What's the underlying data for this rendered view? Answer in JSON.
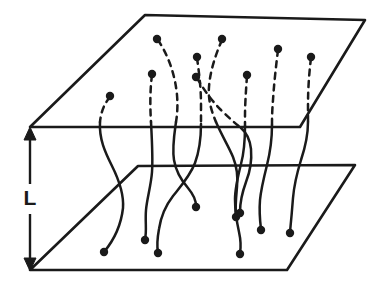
{
  "figure": {
    "background_color": "#ffffff",
    "ink_color": "#1a1a1a",
    "width": 385,
    "height": 300
  },
  "dimension": {
    "label": "L",
    "label_x": 30,
    "label_y": 199,
    "line_x": 30,
    "line_top_y": 130,
    "line_bottom_y": 268,
    "gap_top_y": 184,
    "gap_bottom_y": 214,
    "arrow_top": "arrow-up-icon",
    "arrow_bottom": "arrow-down-icon",
    "arrow_half_width": 6,
    "arrow_length": 13
  },
  "planes": [
    {
      "name": "top-plane",
      "role": "upper boundary surface",
      "corners": [
        [
          145,
          15
        ],
        [
          365,
          20
        ],
        [
          300,
          127
        ],
        [
          30,
          127
        ]
      ],
      "back_left": [
        145,
        15
      ],
      "back_right": [
        365,
        20
      ],
      "front_right": [
        300,
        127
      ],
      "front_left": [
        30,
        127
      ]
    },
    {
      "name": "bottom-plane",
      "role": "lower boundary surface",
      "corners": [
        [
          138,
          166
        ],
        [
          355,
          165
        ],
        [
          287,
          270
        ],
        [
          30,
          270
        ]
      ],
      "back_left": [
        138,
        166
      ],
      "back_right": [
        355,
        165
      ],
      "front_right": [
        287,
        270
      ],
      "front_left": [
        30,
        270
      ]
    }
  ],
  "chains": [
    {
      "id": "chain-1",
      "dashed_path": "M 110,97 C 104,104 101,112 100,122",
      "solid_path": "M 100,122 C 99,139 105,152 112,166 C 119,180 124,194 123,208 C 121,226 114,240 104,252",
      "top_dot": [
        110,
        96
      ],
      "bottom_dot": [
        104,
        252
      ]
    },
    {
      "id": "chain-2",
      "dashed_path": "M 152,75 C 150,90 150,106 151,122",
      "solid_path": "M 151,122 C 152,141 153,158 152,172 C 151,186 147,198 146,210 C 145,222 147,231 145,239",
      "top_dot": [
        152,
        74
      ],
      "bottom_dot": [
        145,
        240
      ]
    },
    {
      "id": "chain-3",
      "dashed_path": "M 158,40 C 168,55 175,74 177,95 C 178,107 177,116 176,122",
      "solid_path": "M 176,122 C 174,136 172,148 174,160 C 176,173 182,181 188,188 C 193,194 196,199 196,206",
      "top_dot": [
        157,
        39
      ],
      "bottom_dot": [
        196,
        207
      ]
    },
    {
      "id": "chain-4",
      "dashed_path": "M 197,58 C 199,72 201,88 201,104 C 201,114 201,120 201,124",
      "solid_path": "M 201,124 C 201,140 199,152 195,163 C 190,176 181,186 173,196 C 166,205 161,216 159,229 C 157,240 157,247 158,252",
      "top_dot": [
        197,
        57
      ],
      "bottom_dot": [
        158,
        253
      ]
    },
    {
      "id": "chain-5",
      "dashed_path": "M 222,40 C 215,56 210,72 209,87 C 208,99 211,110 216,122",
      "solid_path": "M 216,122 C 222,136 229,147 233,157 C 237,167 238,177 237,187 C 236,198 235,208 236,216",
      "top_dot": [
        222,
        39
      ],
      "bottom_dot": [
        236,
        217
      ]
    },
    {
      "id": "chain-6",
      "dashed_path": "M 197,78 C 204,90 212,101 221,110 C 229,118 236,124 241,128",
      "solid_path": "M 241,128 C 247,133 250,140 251,149 C 252,161 250,172 246,182 C 242,193 240,203 240,212",
      "top_dot": [
        196,
        77
      ],
      "bottom_dot": [
        240,
        213
      ]
    },
    {
      "id": "chain-7",
      "dashed_path": "M 247,76 C 246,90 245,104 245,116 C 245,121 245,124 245,126",
      "solid_path": "M 245,126 C 245,141 244,153 241,164 C 238,176 235,188 235,199 C 235,212 237,223 239,232 C 241,241 241,247 240,253",
      "top_dot": [
        247,
        75
      ],
      "bottom_dot": [
        240,
        254
      ]
    },
    {
      "id": "chain-8",
      "dashed_path": "M 278,50 C 276,66 274,84 273,100 C 272,112 272,120 272,125",
      "solid_path": "M 272,125 C 272,141 270,153 267,165 C 264,177 261,189 260,200 C 259,212 260,221 261,229",
      "top_dot": [
        278,
        49
      ],
      "bottom_dot": [
        261,
        230
      ]
    },
    {
      "id": "chain-9",
      "dashed_path": "M 311,58 C 309,74 308,90 308,104 C 308,112 308,118 308,122",
      "solid_path": "M 308,122 C 308,136 305,148 301,160 C 297,173 294,186 293,198 C 292,211 291,222 290,232",
      "top_dot": [
        311,
        57
      ],
      "bottom_dot": [
        290,
        233
      ]
    }
  ],
  "legend": {
    "dashed_meaning": "chain segment above the upper plane",
    "solid_meaning": "chain segment between the planes",
    "dot_meaning": "chain end point"
  }
}
